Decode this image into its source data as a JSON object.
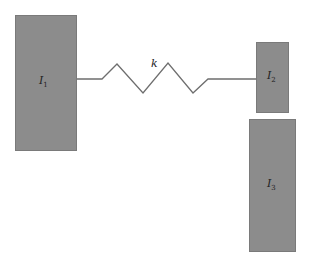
{
  "diagram": {
    "type": "mechanical-spring-inertia",
    "colors": {
      "block_fill": "#8c8c8c",
      "spring_stroke": "#6e6e6e",
      "background": "#ffffff"
    },
    "blocks": [
      {
        "id": "I1",
        "symbol": "I",
        "subscript": "1",
        "x": 15,
        "y": 15,
        "w": 62,
        "h": 136
      },
      {
        "id": "I2",
        "symbol": "I",
        "subscript": "2",
        "x": 256,
        "y": 42,
        "w": 33,
        "h": 71
      },
      {
        "id": "I3",
        "symbol": "I",
        "subscript": "3",
        "x": 249,
        "y": 119,
        "w": 47,
        "h": 133
      }
    ],
    "spring": {
      "label": "k",
      "points": "77,79 102,79 117,64 143,93 168,63 193,93 208,79 256,79"
    }
  }
}
